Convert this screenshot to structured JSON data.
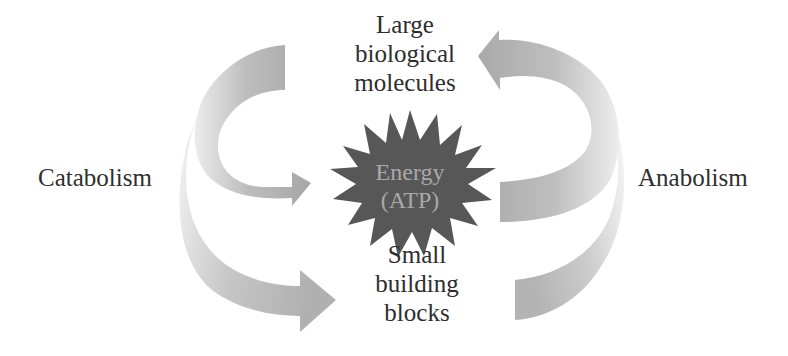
{
  "diagram": {
    "top_node": {
      "lines": [
        "Large",
        "biological",
        "molecules"
      ]
    },
    "center_node": {
      "lines": [
        "Energy",
        "(ATP)"
      ],
      "shape": "starburst",
      "fill": "#5a5a5a",
      "text_color": "#a9a9a9"
    },
    "bottom_node": {
      "lines": [
        "Small",
        "building",
        "blocks"
      ]
    },
    "left_process": {
      "label": "Catabolism"
    },
    "right_process": {
      "label": "Anabolism"
    },
    "arrows": [
      {
        "id": "catabolism-to-energy",
        "from": "Large biological molecules",
        "to": "Energy (ATP)",
        "side": "left"
      },
      {
        "id": "catabolism-to-blocks",
        "from": "Large biological molecules",
        "to": "Small building blocks",
        "side": "left"
      },
      {
        "id": "anabolism-energy-to-molecules",
        "from": "Energy (ATP)",
        "to": "Large biological molecules",
        "side": "right"
      },
      {
        "id": "anabolism-blocks-to-molecules",
        "from": "Small building blocks",
        "to": "Large biological molecules",
        "side": "right"
      }
    ],
    "colors": {
      "arrow": "#a8a8a8",
      "arrow_light": "#e6e6e6",
      "text": "#2e2e2e",
      "background": "#ffffff"
    }
  }
}
